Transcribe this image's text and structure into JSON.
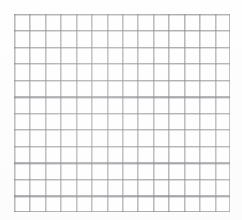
{
  "document": {
    "kind": "graph-paper-sheet",
    "background_color": "#fdfdfd",
    "sheet_color": "#fefefe"
  },
  "chart_data": {
    "type": "table",
    "title": "",
    "subtitle": "",
    "xlabel": "",
    "ylabel": "",
    "columns": 14,
    "rows": 12,
    "cell_width_px": 15.43,
    "cell_height_px": 16.5,
    "grid": true,
    "legend": "none",
    "series": [],
    "categories": [],
    "values": [],
    "annotations": [],
    "tick_labels": {
      "x": [],
      "y": []
    },
    "bounds_px": {
      "left": 14,
      "top": 14,
      "right": 230,
      "bottom": 212,
      "width": 216,
      "height": 198
    },
    "line_color": "#84848a",
    "line_width_px": 1
  }
}
